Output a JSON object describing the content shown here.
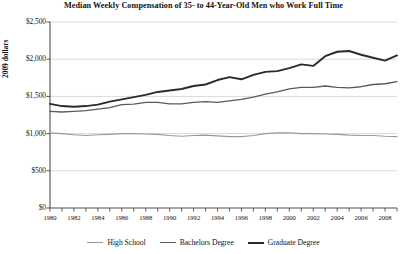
{
  "chart_data": {
    "type": "line",
    "title": "Median Weekly Compensation of 35- to 44-Year-Old Men who Work Full Time",
    "xlabel": "",
    "ylabel": "2009 dollars",
    "grid": true,
    "legend_position": "bottom",
    "xlim": [
      1980,
      2009
    ],
    "ylim": [
      0,
      2500
    ],
    "ytick_labels": [
      "$0",
      "$500",
      "$1,000",
      "$1,500",
      "$2,000",
      "$2,500"
    ],
    "ytick_values": [
      0,
      500,
      1000,
      1500,
      2000,
      2500
    ],
    "xtick_labels": [
      "1980",
      "1982",
      "1984",
      "1986",
      "1988",
      "1990",
      "1992",
      "1994",
      "1996",
      "1998",
      "2000",
      "2002",
      "2004",
      "2006",
      "2008"
    ],
    "xtick_values": [
      1980,
      1982,
      1984,
      1986,
      1988,
      1990,
      1992,
      1994,
      1996,
      1998,
      2000,
      2002,
      2004,
      2006,
      2008
    ],
    "x": [
      1980,
      1981,
      1982,
      1983,
      1984,
      1985,
      1986,
      1987,
      1988,
      1989,
      1990,
      1991,
      1992,
      1993,
      1994,
      1995,
      1996,
      1997,
      1998,
      1999,
      2000,
      2001,
      2002,
      2003,
      2004,
      2005,
      2006,
      2007,
      2008,
      2009
    ],
    "series": [
      {
        "name": "High School",
        "color": "#9a9a9a",
        "width": 1.1,
        "values": [
          1010,
          1000,
          985,
          975,
          985,
          990,
          1000,
          1000,
          995,
          990,
          975,
          965,
          975,
          980,
          970,
          960,
          960,
          975,
          1000,
          1010,
          1010,
          1000,
          1000,
          995,
          990,
          980,
          975,
          975,
          965,
          960
        ]
      },
      {
        "name": "Bachelors Degree",
        "color": "#5a5a5a",
        "width": 1.3,
        "values": [
          1300,
          1290,
          1300,
          1310,
          1330,
          1350,
          1390,
          1395,
          1420,
          1420,
          1400,
          1400,
          1420,
          1430,
          1420,
          1440,
          1460,
          1490,
          1530,
          1560,
          1600,
          1620,
          1620,
          1640,
          1620,
          1615,
          1630,
          1660,
          1670,
          1700
        ]
      },
      {
        "name": "Graduate Degree",
        "color": "#2b2b2b",
        "width": 1.9,
        "values": [
          1400,
          1370,
          1360,
          1370,
          1390,
          1430,
          1460,
          1490,
          1520,
          1560,
          1580,
          1600,
          1640,
          1660,
          1720,
          1760,
          1730,
          1790,
          1830,
          1840,
          1880,
          1930,
          1910,
          2040,
          2100,
          2110,
          2060,
          2020,
          1980,
          2050
        ]
      }
    ]
  },
  "legend": {
    "items": [
      {
        "label": "High School"
      },
      {
        "label": "Bachelors Degree"
      },
      {
        "label": "Graduate Degree"
      }
    ]
  },
  "colors": {
    "background": "#ffffff",
    "axis": "#4d4d4d",
    "grid": "#c8c8c8",
    "text": "#111111"
  }
}
